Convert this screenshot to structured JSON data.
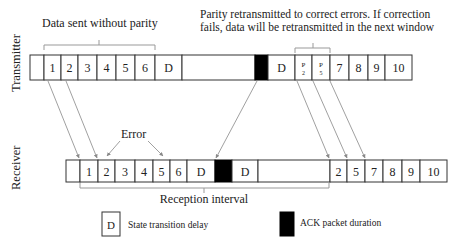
{
  "annotations": {
    "top_left": "Data sent without parity",
    "top_right_line1": "Parity retransmitted to correct errors. If correction",
    "top_right_line2": "fails, data will be retransmitted in the next window",
    "error": "Error",
    "reception_interval": "Reception  interval"
  },
  "axis_labels": {
    "transmitter": "Transmitter",
    "receiver": "Receiver"
  },
  "transmitter": {
    "cells": [
      {
        "label": "",
        "type": "blank"
      },
      {
        "label": "1",
        "type": "data"
      },
      {
        "label": "2",
        "type": "data"
      },
      {
        "label": "3",
        "type": "data"
      },
      {
        "label": "4",
        "type": "data"
      },
      {
        "label": "5",
        "type": "data"
      },
      {
        "label": "6",
        "type": "data"
      },
      {
        "label": "D",
        "type": "delay"
      },
      {
        "label": "",
        "type": "blank"
      },
      {
        "label": "",
        "type": "ack"
      },
      {
        "label": "D",
        "type": "delay"
      },
      {
        "label": "P",
        "sub": "2",
        "type": "parity"
      },
      {
        "label": "P",
        "sub": "5",
        "type": "parity"
      },
      {
        "label": "7",
        "type": "data"
      },
      {
        "label": "8",
        "type": "data"
      },
      {
        "label": "9",
        "type": "data"
      },
      {
        "label": "10",
        "type": "data"
      }
    ]
  },
  "receiver": {
    "cells": [
      {
        "label": "",
        "type": "blank"
      },
      {
        "label": "1",
        "type": "data"
      },
      {
        "label": "2",
        "type": "data"
      },
      {
        "label": "3",
        "type": "data"
      },
      {
        "label": "4",
        "type": "data"
      },
      {
        "label": "5",
        "type": "data"
      },
      {
        "label": "6",
        "type": "data"
      },
      {
        "label": "D",
        "type": "delay"
      },
      {
        "label": "",
        "type": "ack"
      },
      {
        "label": "D",
        "type": "delay"
      },
      {
        "label": "",
        "type": "blank"
      },
      {
        "label": "2",
        "type": "data"
      },
      {
        "label": "5",
        "type": "data"
      },
      {
        "label": "7",
        "type": "data"
      },
      {
        "label": "8",
        "type": "data"
      },
      {
        "label": "9",
        "type": "data"
      },
      {
        "label": "10",
        "type": "data"
      }
    ]
  },
  "legend": {
    "delay_symbol": "D",
    "delay_label": "State transition delay",
    "ack_label": "ACK packet duration"
  },
  "colors": {
    "ack": "#000000",
    "arrow": "#888888",
    "border": "#333333"
  }
}
